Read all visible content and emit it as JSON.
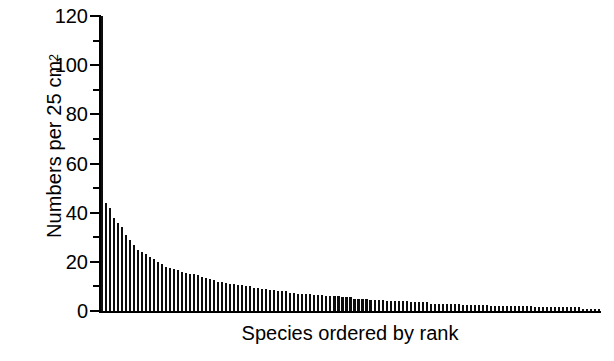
{
  "chart_data": {
    "type": "bar",
    "title": "",
    "subtitle": "",
    "xlabel": "Species ordered by rank",
    "ylabel": "Numbers per 25 cm",
    "ylabel_superscript": "2",
    "ylim": [
      0,
      120
    ],
    "yticks": [
      0,
      20,
      40,
      60,
      80,
      100,
      120
    ],
    "ytick_labels": [
      "0",
      "20",
      "40",
      "60",
      "80",
      "100",
      "120"
    ],
    "yminor_ticks": [
      10,
      30,
      50,
      70,
      90,
      110
    ],
    "xticks": [],
    "xtick_labels": [],
    "grid": false,
    "legend": false,
    "bar_color": "#0d0d0d",
    "background": "#ffffff",
    "axis_color": "#000000",
    "note_first_bar_clipped": "Rank 1 bar extends above the 120 axis maximum and is clipped by the plot frame.",
    "categories": [
      "1",
      "2",
      "3",
      "4",
      "5",
      "6",
      "7",
      "8",
      "9",
      "10",
      "11",
      "12",
      "13",
      "14",
      "15",
      "16",
      "17",
      "18",
      "19",
      "20",
      "21",
      "22",
      "23",
      "24",
      "25",
      "26",
      "27",
      "28",
      "29",
      "30",
      "31",
      "32",
      "33",
      "34",
      "35",
      "36",
      "37",
      "38",
      "39",
      "40",
      "41",
      "42",
      "43",
      "44",
      "45",
      "46",
      "47",
      "48",
      "49",
      "50",
      "51",
      "52",
      "53",
      "54",
      "55",
      "56",
      "57",
      "58",
      "59",
      "60",
      "61",
      "62",
      "63",
      "64",
      "65",
      "66",
      "67",
      "68",
      "69",
      "70",
      "71",
      "72",
      "73",
      "74",
      "75",
      "76",
      "77",
      "78",
      "79",
      "80",
      "81",
      "82",
      "83",
      "84",
      "85",
      "86",
      "87",
      "88",
      "89",
      "90",
      "91",
      "92",
      "93",
      "94",
      "95",
      "96",
      "97",
      "98",
      "99",
      "100",
      "101",
      "102",
      "103",
      "104",
      "105",
      "106",
      "107",
      "108",
      "109",
      "110",
      "111",
      "112",
      "113",
      "114",
      "115",
      "116",
      "117",
      "118",
      "119",
      "120",
      "121",
      "122",
      "123",
      "124",
      "125"
    ],
    "values": [
      128,
      44,
      42,
      38,
      36,
      34,
      31,
      29,
      27,
      25,
      24,
      23,
      22,
      21,
      20,
      19,
      18,
      17.5,
      17,
      16.5,
      16,
      15.5,
      15,
      15,
      14.5,
      14,
      13.5,
      13,
      12.5,
      12,
      12,
      11.5,
      11,
      11,
      10.5,
      10.5,
      10,
      10,
      9.5,
      9.5,
      9,
      9,
      8.5,
      8.5,
      8,
      8,
      8,
      7.5,
      7.5,
      7,
      7,
      7,
      7,
      6.5,
      6.5,
      6.5,
      6,
      6,
      6,
      6,
      5.5,
      5.5,
      5.5,
      5,
      5,
      5,
      5,
      4.5,
      4.5,
      4.5,
      4.5,
      4,
      4,
      4,
      4,
      4,
      4,
      3.5,
      3.5,
      3.5,
      3.5,
      3.5,
      3,
      3,
      3,
      3,
      3,
      3,
      3,
      3,
      2.5,
      2.5,
      2.5,
      2.5,
      2.5,
      2.5,
      2.5,
      2,
      2,
      2,
      2,
      2,
      2,
      2,
      2,
      2,
      2,
      2,
      1.5,
      1.5,
      1.5,
      1.5,
      1.5,
      1.5,
      1.5,
      1.5,
      1.5,
      1.5,
      1.5,
      1.5,
      1,
      1,
      1,
      1,
      1
    ]
  }
}
